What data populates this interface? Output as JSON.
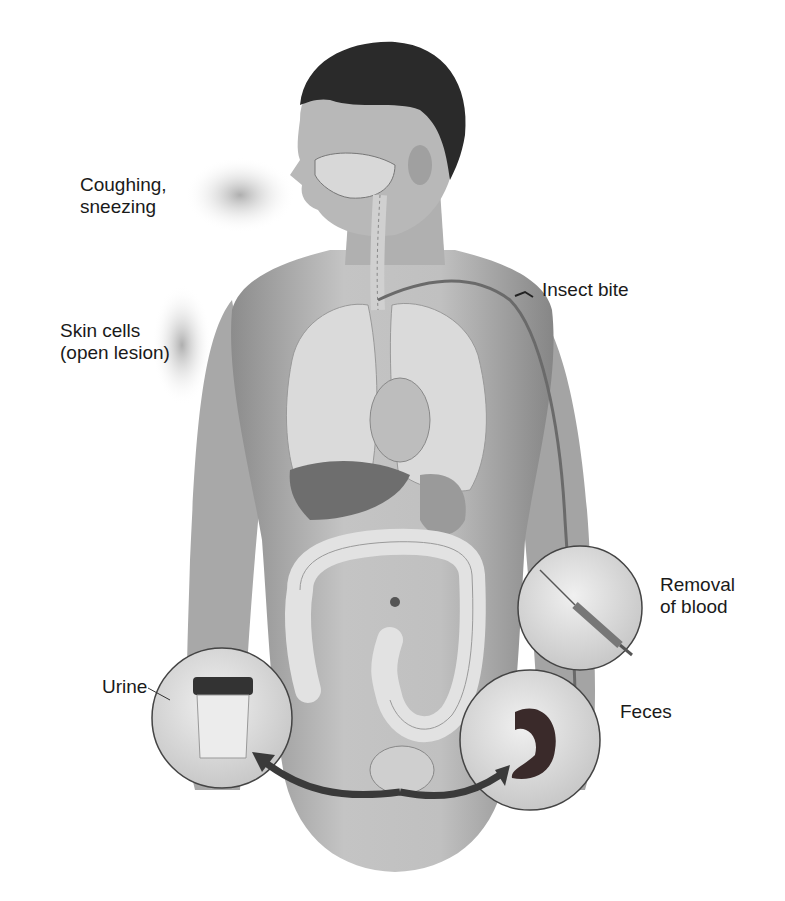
{
  "figure": {
    "labels": {
      "coughing": "Coughing,\nsneezing",
      "skin": "Skin cells\n(open lesion)",
      "insect": "Insect bite",
      "blood": "Removal\nof blood",
      "urine": "Urine",
      "feces": "Feces"
    },
    "colors": {
      "skin": "#b9b9b9",
      "skin_dark": "#8a8a8a",
      "hair": "#2a2a2a",
      "organ": "#d8d8d8",
      "liver": "#6e6e6e",
      "inset_fill": "#dcdcdc",
      "arrow": "#3a3a3a",
      "text": "#1a1a1a"
    }
  }
}
